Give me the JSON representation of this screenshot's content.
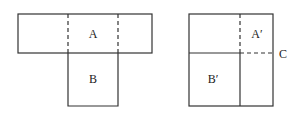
{
  "figure_left": {
    "label_top": "A",
    "label_bottom": "B"
  },
  "figure_right": {
    "label_top_right": "A′",
    "label_bottom_left": "B′",
    "label_side": "C"
  },
  "colors": {
    "stroke": "#333333",
    "background": "#ffffff"
  }
}
